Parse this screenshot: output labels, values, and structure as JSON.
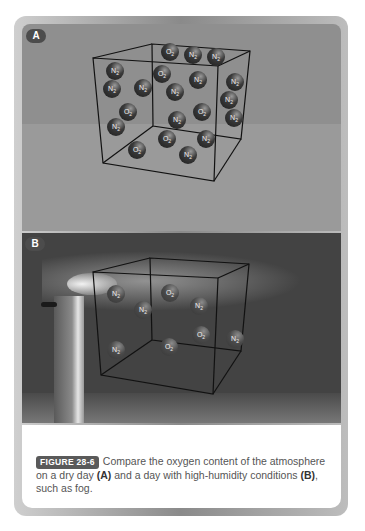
{
  "figure": {
    "panels": [
      {
        "label": "A",
        "condition": "dry day",
        "molecules": [
          {
            "formula": "O2",
            "x": 170,
            "y": 52
          },
          {
            "formula": "N2",
            "x": 193,
            "y": 55
          },
          {
            "formula": "N2",
            "x": 216,
            "y": 57
          },
          {
            "formula": "N2",
            "x": 115,
            "y": 71
          },
          {
            "formula": "O2",
            "x": 162,
            "y": 74
          },
          {
            "formula": "N2",
            "x": 198,
            "y": 80
          },
          {
            "formula": "N2",
            "x": 235,
            "y": 82
          },
          {
            "formula": "N2",
            "x": 112,
            "y": 89
          },
          {
            "formula": "N2",
            "x": 143,
            "y": 88
          },
          {
            "formula": "N2",
            "x": 175,
            "y": 92
          },
          {
            "formula": "N2",
            "x": 229,
            "y": 100
          },
          {
            "formula": "O2",
            "x": 128,
            "y": 112
          },
          {
            "formula": "O2",
            "x": 202,
            "y": 112
          },
          {
            "formula": "N2",
            "x": 234,
            "y": 118
          },
          {
            "formula": "N2",
            "x": 116,
            "y": 127
          },
          {
            "formula": "N2",
            "x": 177,
            "y": 120
          },
          {
            "formula": "O2",
            "x": 167,
            "y": 139
          },
          {
            "formula": "N2",
            "x": 206,
            "y": 139
          },
          {
            "formula": "O2",
            "x": 137,
            "y": 150
          },
          {
            "formula": "N2",
            "x": 188,
            "y": 155
          }
        ]
      },
      {
        "label": "B",
        "condition": "high-humidity",
        "molecules": [
          {
            "formula": "N2",
            "x": 116,
            "y": 294
          },
          {
            "formula": "O2",
            "x": 170,
            "y": 293
          },
          {
            "formula": "N2",
            "x": 199,
            "y": 306
          },
          {
            "formula": "N2",
            "x": 143,
            "y": 310
          },
          {
            "formula": "O2",
            "x": 201,
            "y": 335
          },
          {
            "formula": "N2",
            "x": 235,
            "y": 339
          },
          {
            "formula": "O2",
            "x": 169,
            "y": 347
          },
          {
            "formula": "N2",
            "x": 116,
            "y": 350
          }
        ]
      }
    ],
    "caption": {
      "figure_label": "FIGURE 28-6",
      "text_1": "Compare the oxygen content of the atmosphere on a dry day ",
      "ref_a": "(A)",
      "text_2": " and a day with high-humidity conditions ",
      "ref_b": "(B)",
      "text_3": ", such as fog."
    }
  }
}
